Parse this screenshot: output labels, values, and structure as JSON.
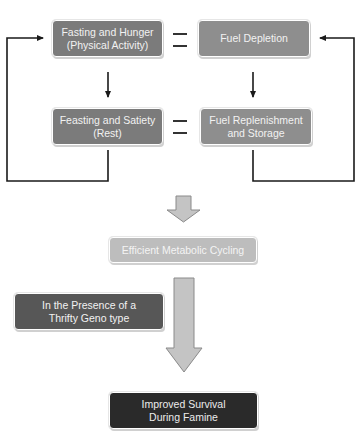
{
  "diagram": {
    "top_left": {
      "line1": "Fasting and Hunger",
      "line2": "(Physical Activity)"
    },
    "top_right": {
      "line1": "Fuel Depletion",
      "line2": ""
    },
    "bottom_left": {
      "line1": "Feasting and Satiety",
      "line2": "(Rest)"
    },
    "bottom_right": {
      "line1": "Fuel Replenishment",
      "line2": "and Storage"
    },
    "equals_symbol": "=",
    "result": "Efficient Metabolic Cycling",
    "condition": {
      "line1": "In the Presence of a",
      "line2": "Thrifty Geno type"
    },
    "outcome": {
      "line1": "Improved Survival",
      "line2": "During Famine"
    }
  },
  "colors": {
    "top_boxes": "#7b7b7b",
    "result_box": "#bdbdbd",
    "condition_box": "#575757",
    "outcome_box": "#2a2a2a",
    "arrow_fill": "#c4c4c4",
    "line": "#1a1a1a"
  }
}
